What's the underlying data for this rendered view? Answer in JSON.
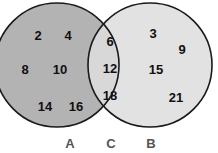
{
  "diagram": {
    "type": "venn",
    "colors": {
      "set_a_fill": "#b3b3b3",
      "set_b_fill": "#e2e2e2",
      "intersection_fill": "#d8d8d8",
      "outline": "#1a1a1a",
      "label_color": "#555555",
      "number_color": "#111111"
    },
    "labels": {
      "a": "A",
      "c": "C",
      "b": "B"
    },
    "regions": {
      "a_only": [
        {
          "value": "2",
          "x": 38,
          "y": 37
        },
        {
          "value": "4",
          "x": 68,
          "y": 37
        },
        {
          "value": "8",
          "x": 25,
          "y": 71
        },
        {
          "value": "10",
          "x": 60,
          "y": 71
        },
        {
          "value": "14",
          "x": 45,
          "y": 108
        },
        {
          "value": "16",
          "x": 76,
          "y": 108
        }
      ],
      "intersection": [
        {
          "value": "6",
          "x": 110,
          "y": 43
        },
        {
          "value": "12",
          "x": 110,
          "y": 70
        },
        {
          "value": "18",
          "x": 110,
          "y": 97
        }
      ],
      "b_only": [
        {
          "value": "3",
          "x": 153,
          "y": 35
        },
        {
          "value": "9",
          "x": 182,
          "y": 51
        },
        {
          "value": "15",
          "x": 156,
          "y": 71
        },
        {
          "value": "21",
          "x": 176,
          "y": 99
        }
      ]
    }
  }
}
